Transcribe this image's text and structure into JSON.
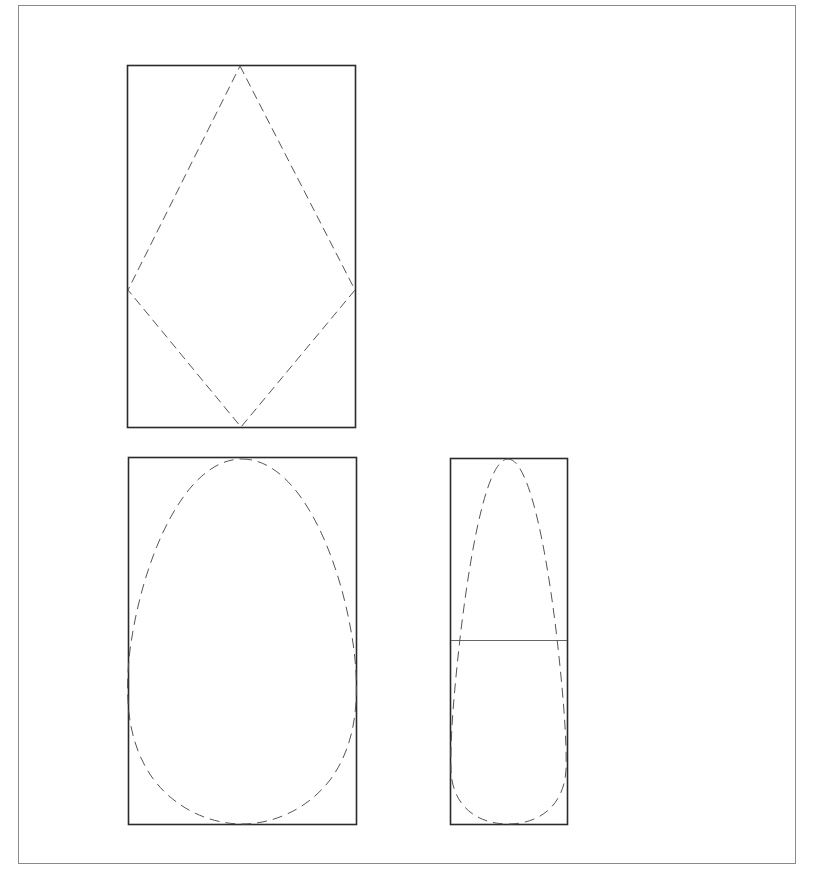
{
  "diagram": {
    "colors": {
      "background": "#ffffff",
      "frame": "#8a8a8a",
      "rect_stroke": "#2a2a2a",
      "dash_stroke": "#555555",
      "divider": "#666666"
    },
    "frame": {
      "x": 18,
      "y": 5,
      "w": 777,
      "h": 858
    },
    "figures": [
      {
        "id": "rhombus-construction",
        "rect": {
          "x": 127,
          "y": 65,
          "w": 228,
          "h": 362
        },
        "shape": "rhombus",
        "points": [
          [
            240,
            65
          ],
          [
            355,
            290
          ],
          [
            241,
            427
          ],
          [
            127,
            290
          ]
        ]
      },
      {
        "id": "egg-wide",
        "rect": {
          "x": 128,
          "y": 457,
          "w": 228,
          "h": 367
        },
        "shape": "egg",
        "top": [
          242,
          459
        ],
        "widest_y": 683,
        "bottom": [
          242,
          824
        ]
      },
      {
        "id": "egg-narrow",
        "rect": {
          "x": 450,
          "y": 458,
          "w": 117,
          "h": 366
        },
        "shape": "narrow-egg",
        "top": [
          508,
          459
        ],
        "divider_y": 640,
        "widest_y": 730,
        "bottom": [
          508,
          824
        ]
      }
    ]
  }
}
